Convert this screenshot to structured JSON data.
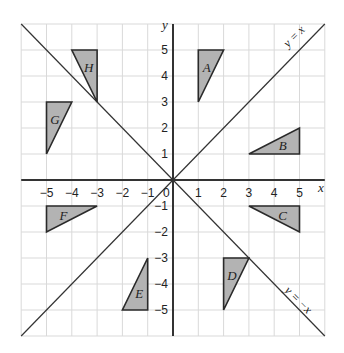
{
  "diagram": {
    "x_axis_label": "x",
    "y_axis_label": "y",
    "origin_label": "0",
    "x_ticks": [
      "-5",
      "-4",
      "-3",
      "-2",
      "-1",
      "1",
      "2",
      "3",
      "4",
      "5"
    ],
    "y_ticks": [
      "5",
      "4",
      "3",
      "2",
      "1",
      "-1",
      "-2",
      "-3",
      "-4",
      "-5"
    ],
    "range": {
      "xmin": -6,
      "xmax": 6,
      "ymin": -6,
      "ymax": 6
    },
    "lines": [
      {
        "name": "y-equals-x",
        "label": "y = x",
        "equation": "y=x"
      },
      {
        "name": "y-equals-minus-x",
        "label": "y = −x",
        "equation": "y=-x"
      }
    ],
    "triangles": [
      {
        "label": "A",
        "vertices": [
          [
            1,
            5
          ],
          [
            2,
            5
          ],
          [
            1,
            3
          ]
        ]
      },
      {
        "label": "B",
        "vertices": [
          [
            3,
            1
          ],
          [
            5,
            1
          ],
          [
            5,
            2
          ]
        ]
      },
      {
        "label": "C",
        "vertices": [
          [
            3,
            -1
          ],
          [
            5,
            -1
          ],
          [
            5,
            -2
          ]
        ]
      },
      {
        "label": "D",
        "vertices": [
          [
            2,
            -3
          ],
          [
            3,
            -3
          ],
          [
            2,
            -5
          ]
        ]
      },
      {
        "label": "E",
        "vertices": [
          [
            -1,
            -3
          ],
          [
            -1,
            -5
          ],
          [
            -2,
            -5
          ]
        ]
      },
      {
        "label": "F",
        "vertices": [
          [
            -5,
            -1
          ],
          [
            -3,
            -1
          ],
          [
            -5,
            -2
          ]
        ]
      },
      {
        "label": "G",
        "vertices": [
          [
            -5,
            3
          ],
          [
            -4,
            3
          ],
          [
            -5,
            1
          ]
        ]
      },
      {
        "label": "H",
        "vertices": [
          [
            -4,
            5
          ],
          [
            -3,
            5
          ],
          [
            -3,
            3
          ]
        ]
      }
    ],
    "colors": {
      "fill": "#b3b3b3",
      "stroke": "#2a2a2a",
      "grid": "#d9d9d9",
      "axis": "#333333"
    }
  }
}
